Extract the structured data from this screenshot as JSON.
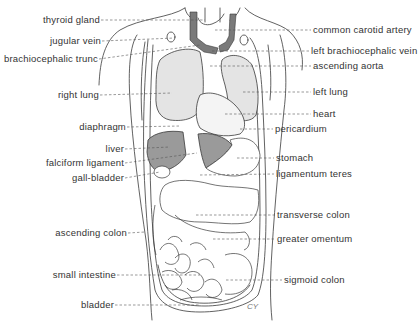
{
  "figure": {
    "signature": "CY",
    "colors": {
      "line": "#3a3a3a",
      "lung_fill": "#e4e4e4",
      "liver_fill": "#9a9a9a",
      "vessel_fill": "#7a7a7a",
      "text": "#333333",
      "background": "#ffffff"
    }
  },
  "labels_left": [
    {
      "text": "thyroid gland",
      "x_right": 100,
      "y": 14,
      "target_x": 205,
      "target_y": 20
    },
    {
      "text": "jugular vein",
      "x_right": 101,
      "y": 35,
      "target_x": 175,
      "target_y": 38
    },
    {
      "text": "brachiocephalic trunc",
      "x_right": 98,
      "y": 53,
      "target_x": 200,
      "target_y": 45
    },
    {
      "text": "right lung",
      "x_right": 99,
      "y": 89,
      "target_x": 172,
      "target_y": 93
    },
    {
      "text": "diaphragm",
      "x_right": 126,
      "y": 121,
      "target_x": 180,
      "target_y": 126
    },
    {
      "text": "liver",
      "x_right": 124,
      "y": 143,
      "target_x": 170,
      "target_y": 147
    },
    {
      "text": "falciform ligament",
      "x_right": 124,
      "y": 157,
      "target_x": 197,
      "target_y": 153
    },
    {
      "text": "gall-bladder",
      "x_right": 124,
      "y": 172,
      "target_x": 160,
      "target_y": 168
    },
    {
      "text": "ascending colon",
      "x_right": 127,
      "y": 227,
      "target_x": 145,
      "target_y": 232
    },
    {
      "text": "small intestine",
      "x_right": 116,
      "y": 269,
      "target_x": 200,
      "target_y": 275
    },
    {
      "text": "bladder",
      "x_right": 114,
      "y": 299,
      "target_x": 200,
      "target_y": 305
    }
  ],
  "labels_right": [
    {
      "text": "common carotid artery",
      "x_left": 313,
      "y": 24,
      "target_x": 215,
      "target_y": 30
    },
    {
      "text": "left brachiocephalic vein",
      "x_left": 311,
      "y": 45,
      "target_x": 212,
      "target_y": 51
    },
    {
      "text": "ascending aorta",
      "x_left": 313,
      "y": 60,
      "target_x": 210,
      "target_y": 66
    },
    {
      "text": "left lung",
      "x_left": 313,
      "y": 86,
      "target_x": 243,
      "target_y": 92
    },
    {
      "text": "heart",
      "x_left": 313,
      "y": 108,
      "target_x": 225,
      "target_y": 114
    },
    {
      "text": "pericardium",
      "x_left": 275,
      "y": 123,
      "target_x": 240,
      "target_y": 129
    },
    {
      "text": "stomach",
      "x_left": 276,
      "y": 152,
      "target_x": 237,
      "target_y": 158
    },
    {
      "text": "ligamentum teres",
      "x_left": 276,
      "y": 168,
      "target_x": 200,
      "target_y": 175
    },
    {
      "text": "transverse colon",
      "x_left": 277,
      "y": 209,
      "target_x": 196,
      "target_y": 215
    },
    {
      "text": "greater omentum",
      "x_left": 277,
      "y": 233,
      "target_x": 213,
      "target_y": 239
    },
    {
      "text": "sigmoid colon",
      "x_left": 284,
      "y": 274,
      "target_x": 226,
      "target_y": 280
    }
  ]
}
